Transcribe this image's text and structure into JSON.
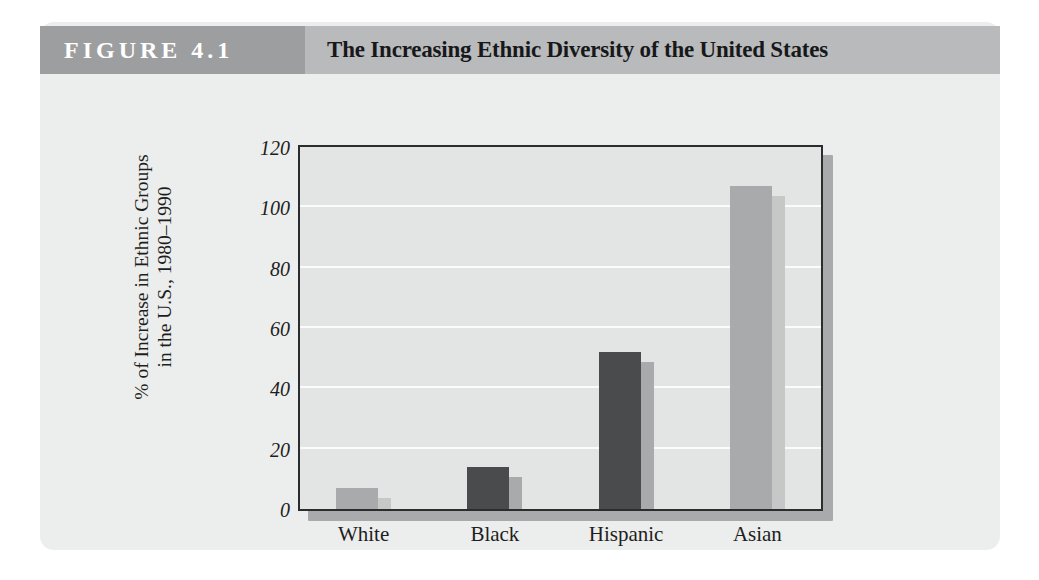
{
  "figure": {
    "number_label": "FIGURE 4.1",
    "title": "The Increasing Ethnic Diversity of the United States"
  },
  "colors": {
    "card_background": "#eceded",
    "header_band": "#b9babb",
    "badge_band": "#9d9e9f",
    "plot_background": "#e3e4e4",
    "plot_border": "#2b2c2e",
    "gridline": "#fbfbfb",
    "bar_light_face": "#a9aaab",
    "bar_light_side": "#c6c7c7",
    "bar_dark_face": "#4a4b4d",
    "bar_dark_side": "#a9aaab",
    "badge_text": "#ffffff",
    "title_text": "#17181a",
    "axis_text": "#1d1e20"
  },
  "chart_data": {
    "type": "bar",
    "title": "The Increasing Ethnic Diversity of the United States",
    "subtitle": "",
    "xlabel": "",
    "ylabel": "% of Increase in Ethnic Groups in the U.S., 1980–1990",
    "ylabel_lines": [
      "% of Increase in Ethnic Groups",
      "in the U.S., 1980–1990"
    ],
    "categories": [
      "White",
      "Black",
      "Hispanic",
      "Asian"
    ],
    "values": [
      7,
      14,
      52,
      107
    ],
    "bar_shades": [
      "light",
      "dark",
      "dark",
      "light"
    ],
    "ylim": [
      0,
      120
    ],
    "yticks": [
      0,
      20,
      40,
      60,
      80,
      100,
      120
    ],
    "ytick_labels": [
      "0",
      "20",
      "40",
      "60",
      "80",
      "100",
      "120"
    ],
    "grid": true,
    "grid_axis": "y",
    "legend": false,
    "legend_position": "none",
    "style_3d": true
  }
}
